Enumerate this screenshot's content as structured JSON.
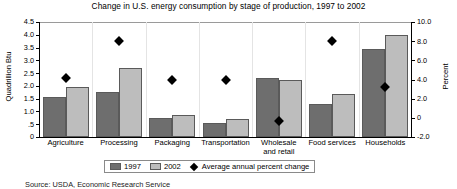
{
  "chart_data": {
    "type": "bar",
    "title": "Change in U.S. energy consumption by stage of production, 1997 to 2002",
    "xlabel": "",
    "ylabel": "Quadrillion Btu",
    "y2label": "Percent",
    "ylim": [
      0,
      4.5
    ],
    "y2lim": [
      -2.0,
      10.0
    ],
    "grid": false,
    "legend_position": "bottom-center",
    "categories": [
      "Agriculture",
      "Processing",
      "Packaging",
      "Transportation",
      "Wholesale\nand retail",
      "Food services",
      "Households"
    ],
    "series": [
      {
        "name": "1997",
        "axis": "left",
        "color": "#6e6e6e",
        "values": [
          1.55,
          1.75,
          0.75,
          0.55,
          2.3,
          1.3,
          3.45
        ]
      },
      {
        "name": "2002",
        "axis": "left",
        "color": "#bdbdbd",
        "values": [
          1.95,
          2.7,
          0.85,
          0.7,
          2.25,
          1.7,
          4.0
        ]
      },
      {
        "name": "Average annual percent change",
        "axis": "right",
        "type": "scatter",
        "marker": "diamond",
        "color": "#000000",
        "values": [
          4.2,
          8.0,
          4.0,
          4.0,
          -0.3,
          8.0,
          3.2
        ]
      }
    ],
    "y_ticks": [
      "4.5",
      "4.0",
      "3.5",
      "3.0",
      "2.5",
      "2.0",
      "1.5",
      "1.0",
      ".5",
      "0"
    ],
    "y2_ticks": [
      "10.0",
      "8.0",
      "6.0",
      "4.0",
      "2.0",
      "0",
      "-2.0"
    ],
    "source": "Source: USDA, Economic Research Service"
  }
}
